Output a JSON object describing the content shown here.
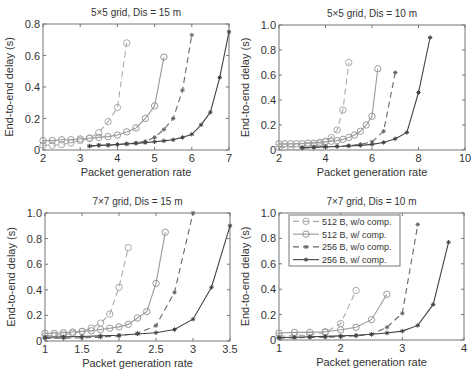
{
  "chart_data": [
    {
      "type": "line",
      "title": "5×5 grid, Dis = 15 m",
      "xlabel": "Packet generation rate",
      "ylabel": "End-to-end delay (s)",
      "xlim": [
        2,
        7
      ],
      "ylim": [
        0,
        0.8
      ],
      "xticks": [
        2,
        3,
        4,
        5,
        6,
        7
      ],
      "yticks": [
        0,
        0.2,
        0.4,
        0.6,
        0.8
      ],
      "ytick_labels": [
        "0",
        "0.2",
        "0.4",
        "0.6",
        "0.8"
      ],
      "frame": {
        "left": 43,
        "top": 24,
        "right": 229,
        "bottom": 150
      },
      "series": [
        {
          "name": "512 B, w/o comp.",
          "x": [
            2,
            2.25,
            2.5,
            2.75,
            3,
            3.25,
            3.5,
            3.75,
            4,
            4.25
          ],
          "y": [
            0.03,
            0.03,
            0.035,
            0.045,
            0.06,
            0.075,
            0.11,
            0.18,
            0.27,
            0.68
          ]
        },
        {
          "name": "512 B, w/ comp.",
          "x": [
            2,
            2.25,
            2.5,
            2.75,
            3,
            3.25,
            3.5,
            3.75,
            4,
            4.25,
            4.5,
            4.75,
            5,
            5.25
          ],
          "y": [
            0.06,
            0.06,
            0.065,
            0.065,
            0.07,
            0.075,
            0.08,
            0.085,
            0.095,
            0.115,
            0.14,
            0.2,
            0.28,
            0.59
          ]
        },
        {
          "name": "256 B, w/o comp.",
          "x": [
            3.25,
            3.5,
            3.75,
            4,
            4.25,
            4.5,
            4.75,
            5,
            5.25,
            5.5,
            5.75,
            6
          ],
          "y": [
            0.025,
            0.03,
            0.03,
            0.035,
            0.04,
            0.045,
            0.055,
            0.08,
            0.13,
            0.2,
            0.38,
            0.73
          ]
        },
        {
          "name": "256 B, w/ comp.",
          "x": [
            3.25,
            3.5,
            3.75,
            4,
            4.25,
            4.5,
            4.75,
            5,
            5.25,
            5.5,
            5.75,
            6,
            6.25,
            6.5,
            6.75,
            7
          ],
          "y": [
            0.025,
            0.03,
            0.032,
            0.035,
            0.038,
            0.042,
            0.047,
            0.052,
            0.058,
            0.065,
            0.08,
            0.1,
            0.16,
            0.24,
            0.46,
            0.75
          ]
        }
      ]
    },
    {
      "type": "line",
      "title": "5×5 grid, Dis = 10 m",
      "xlabel": "Packet generation rate",
      "ylabel": "End-to-end delay (s)",
      "xlim": [
        2,
        10
      ],
      "ylim": [
        0,
        1.0
      ],
      "xticks": [
        2,
        4,
        6,
        8,
        10
      ],
      "yticks": [
        0,
        0.2,
        0.4,
        0.6,
        0.8,
        1.0
      ],
      "ytick_labels": [
        "0",
        "0.2",
        "0.4",
        "0.6",
        "0.8",
        "1.0"
      ],
      "frame": {
        "left": 279,
        "top": 25,
        "right": 465,
        "bottom": 150
      },
      "series": [
        {
          "name": "512 B, w/o comp.",
          "x": [
            2,
            2.25,
            2.5,
            2.75,
            3,
            3.25,
            3.5,
            3.75,
            4,
            4.25,
            4.5,
            4.75,
            5
          ],
          "y": [
            0.02,
            0.02,
            0.025,
            0.025,
            0.03,
            0.035,
            0.04,
            0.05,
            0.07,
            0.1,
            0.16,
            0.32,
            0.7
          ]
        },
        {
          "name": "512 B, w/ comp.",
          "x": [
            2,
            2.25,
            2.5,
            2.75,
            3,
            3.25,
            3.5,
            3.75,
            4,
            4.25,
            4.5,
            4.75,
            5,
            5.25,
            5.5,
            5.75,
            6,
            6.25
          ],
          "y": [
            0.05,
            0.05,
            0.05,
            0.05,
            0.05,
            0.055,
            0.055,
            0.06,
            0.065,
            0.07,
            0.075,
            0.085,
            0.1,
            0.12,
            0.15,
            0.2,
            0.27,
            0.65
          ]
        },
        {
          "name": "256 B, w/o comp.",
          "x": [
            3,
            3.5,
            4,
            4.5,
            5,
            5.5,
            6,
            6.5,
            7
          ],
          "y": [
            0.015,
            0.02,
            0.025,
            0.03,
            0.035,
            0.045,
            0.065,
            0.15,
            0.62
          ]
        },
        {
          "name": "256 B, w/ comp.",
          "x": [
            3,
            3.5,
            4,
            4.5,
            5,
            5.5,
            6,
            6.5,
            7,
            7.5,
            8,
            8.5
          ],
          "y": [
            0.02,
            0.022,
            0.025,
            0.028,
            0.032,
            0.037,
            0.045,
            0.06,
            0.09,
            0.14,
            0.46,
            0.9
          ]
        }
      ]
    },
    {
      "type": "line",
      "title": "7×7 grid, Dis = 15 m",
      "xlabel": "Packet generation rate",
      "ylabel": "End-to-end delay (s)",
      "xlim": [
        1,
        3.5
      ],
      "ylim": [
        0,
        1.0
      ],
      "xticks": [
        1,
        1.5,
        2,
        2.5,
        3,
        3.5
      ],
      "yticks": [
        0,
        0.2,
        0.4,
        0.6,
        0.8,
        1.0
      ],
      "ytick_labels": [
        "0",
        "0.2",
        "0.4",
        "0.6",
        "0.8",
        "1.0"
      ],
      "frame": {
        "left": 45,
        "top": 213,
        "right": 230,
        "bottom": 341
      },
      "series": [
        {
          "name": "512 B, w/o comp.",
          "x": [
            1,
            1.125,
            1.25,
            1.375,
            1.5,
            1.625,
            1.75,
            1.875,
            2,
            2.125
          ],
          "y": [
            0.04,
            0.045,
            0.05,
            0.06,
            0.075,
            0.1,
            0.14,
            0.21,
            0.42,
            0.73
          ]
        },
        {
          "name": "512 B, w/ comp.",
          "x": [
            1,
            1.125,
            1.25,
            1.375,
            1.5,
            1.625,
            1.75,
            1.875,
            2,
            2.125,
            2.25,
            2.375,
            2.5,
            2.625
          ],
          "y": [
            0.06,
            0.06,
            0.065,
            0.07,
            0.075,
            0.08,
            0.09,
            0.1,
            0.11,
            0.13,
            0.18,
            0.23,
            0.45,
            0.85
          ]
        },
        {
          "name": "256 B, w/o comp.",
          "x": [
            1,
            1.25,
            1.5,
            1.75,
            2,
            2.25,
            2.5,
            2.75,
            3
          ],
          "y": [
            0.02,
            0.022,
            0.025,
            0.03,
            0.04,
            0.06,
            0.12,
            0.38,
            1.0
          ]
        },
        {
          "name": "256 B, w/ comp.",
          "x": [
            1,
            1.25,
            1.5,
            1.75,
            2,
            2.25,
            2.5,
            2.75,
            3,
            3.25,
            3.5
          ],
          "y": [
            0.03,
            0.032,
            0.035,
            0.04,
            0.045,
            0.055,
            0.065,
            0.09,
            0.17,
            0.42,
            0.9
          ]
        }
      ]
    },
    {
      "type": "line",
      "title": "7×7 grid, Dis = 10 m",
      "xlabel": "Packet generation rate",
      "ylabel": "End-to-end delay (s)",
      "xlim": [
        1,
        4
      ],
      "ylim": [
        0,
        1.0
      ],
      "xticks": [
        1,
        2,
        3,
        4
      ],
      "yticks": [
        0,
        0.2,
        0.4,
        0.6,
        0.8,
        1.0
      ],
      "ytick_labels": [
        "0",
        "0.2",
        "0.4",
        "0.6",
        "0.8",
        "1.0"
      ],
      "frame": {
        "left": 279,
        "top": 213,
        "right": 464,
        "bottom": 340
      },
      "legend": {
        "position": "upper left",
        "box": {
          "left": 289,
          "top": 215,
          "right": 400,
          "bottom": 266
        }
      },
      "series": [
        {
          "name": "512 B, w/o comp.",
          "x": [
            1,
            1.25,
            1.5,
            1.75,
            2,
            2.25
          ],
          "y": [
            0.03,
            0.035,
            0.04,
            0.06,
            0.13,
            0.39
          ]
        },
        {
          "name": "512 B, w/ comp.",
          "x": [
            1,
            1.25,
            1.5,
            1.75,
            2,
            2.25,
            2.5,
            2.75
          ],
          "y": [
            0.055,
            0.06,
            0.06,
            0.065,
            0.08,
            0.1,
            0.16,
            0.36
          ]
        },
        {
          "name": "256 B, w/o comp.",
          "x": [
            1,
            1.25,
            1.5,
            1.75,
            2,
            2.25,
            2.5,
            2.75,
            3,
            3.25
          ],
          "y": [
            0.015,
            0.018,
            0.02,
            0.022,
            0.026,
            0.032,
            0.045,
            0.1,
            0.21,
            0.91
          ]
        },
        {
          "name": "256 B, w/ comp.",
          "x": [
            1,
            1.25,
            1.5,
            1.75,
            2,
            2.25,
            2.5,
            2.75,
            3,
            3.25,
            3.5,
            3.75
          ],
          "y": [
            0.02,
            0.022,
            0.025,
            0.028,
            0.032,
            0.037,
            0.045,
            0.055,
            0.07,
            0.115,
            0.28,
            0.77
          ]
        }
      ]
    }
  ],
  "legend": {
    "entries": [
      {
        "label": "512 B, w/o comp.",
        "color": "#aaaaaa",
        "dash": "6,4",
        "marker": "circle"
      },
      {
        "label": "512 B, w/ comp.",
        "color": "#999999",
        "dash": "",
        "marker": "circle"
      },
      {
        "label": "256 B, w/o comp.",
        "color": "#666666",
        "dash": "6,4",
        "marker": "star"
      },
      {
        "label": "256 B, w/ comp.",
        "color": "#444444",
        "dash": "",
        "marker": "star"
      }
    ]
  }
}
